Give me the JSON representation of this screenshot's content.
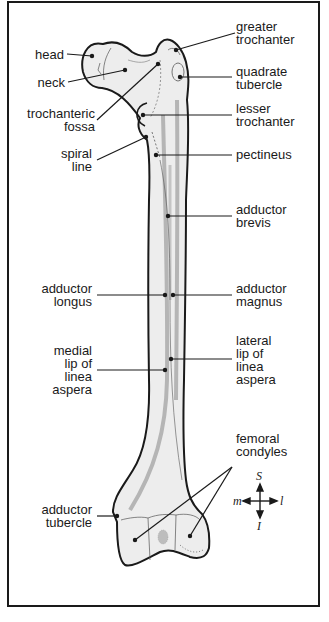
{
  "figure": {
    "labels_left": [
      {
        "id": "head",
        "text": "head"
      },
      {
        "id": "neck",
        "text": "neck"
      },
      {
        "id": "trochanteric_fossa",
        "text": "trochanteric\nfossa"
      },
      {
        "id": "spiral_line",
        "text": "spiral\nline"
      },
      {
        "id": "adductor_longus",
        "text": "adductor\nlongus"
      },
      {
        "id": "medial_lip",
        "text": "medial\nlip of\nlinea\naspera"
      },
      {
        "id": "adductor_tubercle",
        "text": "adductor\ntubercle"
      }
    ],
    "labels_right": [
      {
        "id": "greater_trochanter",
        "text": "greater\ntrochanter"
      },
      {
        "id": "quadrate_tubercle",
        "text": "quadrate\ntubercle"
      },
      {
        "id": "lesser_trochanter",
        "text": "lesser\ntrochanter"
      },
      {
        "id": "pectineus",
        "text": "pectineus"
      },
      {
        "id": "adductor_brevis",
        "text": "adductor\nbrevis"
      },
      {
        "id": "adductor_magnus",
        "text": "adductor\nmagnus"
      },
      {
        "id": "lateral_lip",
        "text": "lateral\nlip of\nlinea\naspera"
      },
      {
        "id": "femoral_condyles",
        "text": "femoral\ncondyles"
      }
    ],
    "compass": {
      "superior": "S",
      "inferior": "I",
      "medial": "m",
      "lateral": "l"
    },
    "colors": {
      "bone_fill": "#ededed",
      "outline": "#1a1a1a",
      "muscle_line": "#b5b5b5",
      "frame": "#1a1a1a"
    }
  }
}
